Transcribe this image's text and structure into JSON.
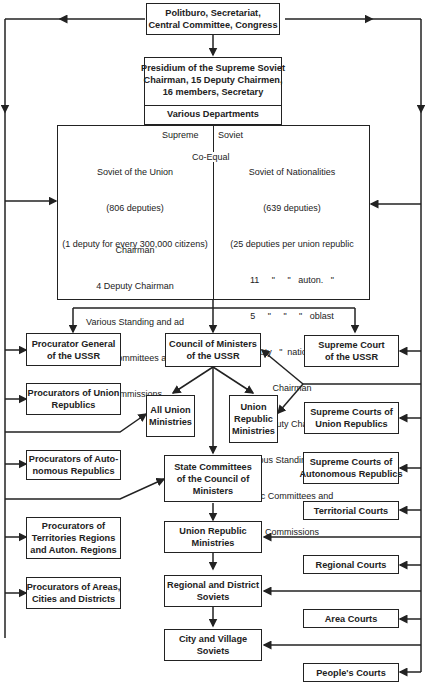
{
  "diagram": {
    "type": "organizational-chart",
    "top": {
      "politburo": [
        "Politburo, Secretariat,",
        "Central Committee, Congress"
      ],
      "presidium": [
        "Presidium of the Supreme Soviet",
        "Chairman, 15 Deputy Chairmen,",
        "16 members, Secretary"
      ],
      "departments": "Various Departments"
    },
    "supreme_soviet": {
      "title_left": "Supreme",
      "title_right": "Soviet",
      "co_equal": "Co-Equal",
      "union": {
        "lines": [
          "Soviet of the Union",
          "(806 deputies)",
          "(1 deputy for every 300,000 citizens)"
        ],
        "officers": [
          "Chairman",
          "4 Deputy Chairman",
          "Various Standing and ad",
          "hoc Committees and",
          "Commissions"
        ]
      },
      "nationalities": {
        "lines": [
          "Soviet of Nationalities",
          "(639 deputies)",
          "(25 deputies per union republic",
          "11     \"     \"   auton.   \"",
          "5     \"     \"     \"   oblast",
          "1 deputy   \"  national okrug)"
        ],
        "officers": [
          "Chairman",
          "4 deputy Chairman",
          "Various Standing and ad",
          "hoc Committees and",
          "Commissions"
        ]
      }
    },
    "left_column": [
      "Procurator General\nof the USSR",
      "Procurators of Union\nRepublics",
      "Procurators of Auto-\nnomous Republics",
      "Procurators of\nTerritories Regions\nand Auton. Regions",
      "Procurators of Areas,\nCities and Districts"
    ],
    "center_column": {
      "council": "Council of Ministers\nof the USSR",
      "all_union": "All Union\nMinistries",
      "union_republic": "Union\nRepublic\nMinistries",
      "state_committees": "State Committees\nof the Council of\nMinisters",
      "union_republic_ministries": "Union Republic\nMinistries",
      "regional_soviets": "Regional and District\nSoviets",
      "city_soviets": "City and Village\nSoviets"
    },
    "right_column": [
      "Supreme Court\nof the USSR",
      "Supreme Courts of\nUnion Republics",
      "Supreme Courts of\nAutonomous Republics",
      "Territorial Courts",
      "Regional Courts",
      "Area Courts",
      "People's Courts"
    ],
    "colors": {
      "line": "#222222",
      "background": "#ffffff"
    }
  }
}
